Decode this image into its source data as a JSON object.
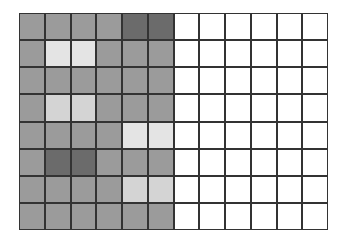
{
  "grid": {
    "rows": 8,
    "cols": 12,
    "colors": {
      "normal": "#9b9b9b",
      "dark": "#6b6b6b",
      "light": "#d4d4d4",
      "lighter": "#e4e4e4",
      "empty": "#ffffff",
      "line": "#333333"
    },
    "cells": [
      [
        "normal",
        "normal",
        "normal",
        "normal",
        "dark",
        "dark",
        "empty",
        "empty",
        "empty",
        "empty",
        "empty",
        "empty"
      ],
      [
        "normal",
        "lighter",
        "lighter",
        "normal",
        "normal",
        "normal",
        "empty",
        "empty",
        "empty",
        "empty",
        "empty",
        "empty"
      ],
      [
        "normal",
        "normal",
        "normal",
        "normal",
        "normal",
        "normal",
        "empty",
        "empty",
        "empty",
        "empty",
        "empty",
        "empty"
      ],
      [
        "normal",
        "light",
        "light",
        "normal",
        "normal",
        "normal",
        "empty",
        "empty",
        "empty",
        "empty",
        "empty",
        "empty"
      ],
      [
        "normal",
        "normal",
        "normal",
        "normal",
        "lighter",
        "lighter",
        "empty",
        "empty",
        "empty",
        "empty",
        "empty",
        "empty"
      ],
      [
        "normal",
        "dark",
        "dark",
        "normal",
        "normal",
        "normal",
        "empty",
        "empty",
        "empty",
        "empty",
        "empty",
        "empty"
      ],
      [
        "normal",
        "normal",
        "normal",
        "normal",
        "light",
        "light",
        "empty",
        "empty",
        "empty",
        "empty",
        "empty",
        "empty"
      ],
      [
        "normal",
        "normal",
        "normal",
        "normal",
        "normal",
        "normal",
        "empty",
        "empty",
        "empty",
        "empty",
        "empty",
        "empty"
      ]
    ]
  }
}
